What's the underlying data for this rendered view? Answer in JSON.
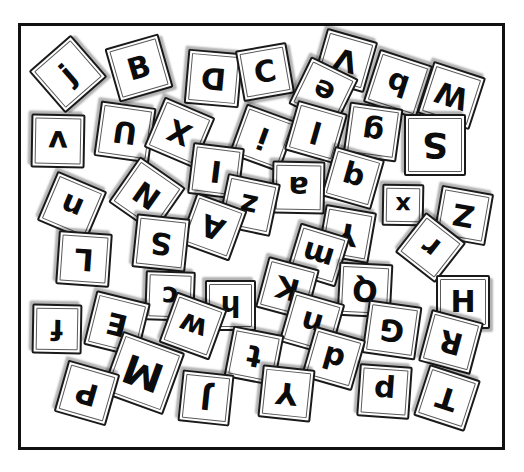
{
  "scene": {
    "title": "Scattered letter tiles inside a rectangular frame",
    "background_color": "#ffffff",
    "frame": {
      "stroke_color": "#111111",
      "fill_color": "#ffffff",
      "stroke_width": 3,
      "x": 18,
      "y": 23,
      "width": 487,
      "height": 427
    },
    "tile_style": {
      "fill_color": "#ffffff",
      "stroke_color": "#1a1a1a",
      "glyph_color": "#0c0c0c",
      "shadow_color": "rgba(0,0,0,0.30)"
    },
    "tile_count": 52
  },
  "tiles": [
    {
      "letter": "j",
      "x": 40,
      "y": 46,
      "size": 56,
      "rot": -41,
      "font": 30
    },
    {
      "letter": "B",
      "x": 111,
      "y": 40,
      "size": 56,
      "rot": -16,
      "font": 30
    },
    {
      "letter": "D",
      "x": 186,
      "y": 51,
      "size": 55,
      "rot": 185,
      "font": 30
    },
    {
      "letter": "C",
      "x": 239,
      "y": 46,
      "size": 52,
      "rot": -10,
      "font": 30
    },
    {
      "letter": "V",
      "x": 319,
      "y": 34,
      "size": 53,
      "rot": 196,
      "font": 30
    },
    {
      "letter": "e",
      "x": 297,
      "y": 65,
      "size": 53,
      "rot": 206,
      "font": 30
    },
    {
      "letter": "b",
      "x": 370,
      "y": 56,
      "size": 56,
      "rot": 198,
      "font": 30
    },
    {
      "letter": "W",
      "x": 424,
      "y": 68,
      "size": 55,
      "rot": 198,
      "font": 30
    },
    {
      "letter": "v",
      "x": 31,
      "y": 114,
      "size": 54,
      "rot": 181,
      "font": 30
    },
    {
      "letter": "U",
      "x": 97,
      "y": 104,
      "size": 56,
      "rot": 188,
      "font": 30
    },
    {
      "letter": "X",
      "x": 152,
      "y": 105,
      "size": 55,
      "rot": 203,
      "font": 30
    },
    {
      "letter": "i",
      "x": 236,
      "y": 111,
      "size": 54,
      "rot": 200,
      "font": 30
    },
    {
      "letter": "l",
      "x": 290,
      "y": 106,
      "size": 52,
      "rot": 196,
      "font": 30
    },
    {
      "letter": "g",
      "x": 346,
      "y": 105,
      "size": 54,
      "rot": 188,
      "font": 30
    },
    {
      "letter": "S",
      "x": 404,
      "y": 114,
      "size": 62,
      "rot": 180,
      "font": 36
    },
    {
      "letter": "I",
      "x": 190,
      "y": 145,
      "size": 52,
      "rot": 187,
      "font": 30
    },
    {
      "letter": "q",
      "x": 327,
      "y": 152,
      "size": 52,
      "rot": 196,
      "font": 30
    },
    {
      "letter": "a",
      "x": 272,
      "y": 161,
      "size": 53,
      "rot": 181,
      "font": 30
    },
    {
      "letter": "n",
      "x": 45,
      "y": 179,
      "size": 54,
      "rot": 203,
      "font": 30
    },
    {
      "letter": "N",
      "x": 119,
      "y": 167,
      "size": 56,
      "rot": 215,
      "font": 30
    },
    {
      "letter": "z",
      "x": 222,
      "y": 178,
      "size": 54,
      "rot": 192,
      "font": 30
    },
    {
      "letter": "x",
      "x": 382,
      "y": 184,
      "size": 42,
      "rot": 181,
      "font": 24
    },
    {
      "letter": "Z",
      "x": 437,
      "y": 189,
      "size": 53,
      "rot": 190,
      "font": 30
    },
    {
      "letter": "A",
      "x": 186,
      "y": 200,
      "size": 54,
      "rot": 200,
      "font": 30
    },
    {
      "letter": "S",
      "x": 134,
      "y": 216,
      "size": 54,
      "rot": 186,
      "font": 30
    },
    {
      "letter": "Y",
      "x": 321,
      "y": 208,
      "size": 52,
      "rot": 190,
      "font": 30
    },
    {
      "letter": "r",
      "x": 405,
      "y": 222,
      "size": 51,
      "rot": 218,
      "font": 30
    },
    {
      "letter": "L",
      "x": 57,
      "y": 232,
      "size": 54,
      "rot": 184,
      "font": 30
    },
    {
      "letter": "m",
      "x": 292,
      "y": 229,
      "size": 52,
      "rot": 197,
      "font": 30
    },
    {
      "letter": "Q",
      "x": 338,
      "y": 263,
      "size": 54,
      "rot": 183,
      "font": 30
    },
    {
      "letter": "c",
      "x": 145,
      "y": 271,
      "size": 50,
      "rot": 182,
      "font": 28
    },
    {
      "letter": "K",
      "x": 261,
      "y": 262,
      "size": 53,
      "rot": 195,
      "font": 30
    },
    {
      "letter": "h",
      "x": 205,
      "y": 280,
      "size": 51,
      "rot": 180,
      "font": 28
    },
    {
      "letter": "H",
      "x": 436,
      "y": 275,
      "size": 54,
      "rot": 0,
      "font": 30
    },
    {
      "letter": "E",
      "x": 89,
      "y": 296,
      "size": 56,
      "rot": 194,
      "font": 30
    },
    {
      "letter": "f",
      "x": 32,
      "y": 304,
      "size": 50,
      "rot": 181,
      "font": 28
    },
    {
      "letter": "w",
      "x": 166,
      "y": 299,
      "size": 54,
      "rot": 200,
      "font": 30
    },
    {
      "letter": "n",
      "x": 285,
      "y": 296,
      "size": 54,
      "rot": 196,
      "font": 30
    },
    {
      "letter": "G",
      "x": 365,
      "y": 303,
      "size": 54,
      "rot": 188,
      "font": 30
    },
    {
      "letter": "R",
      "x": 424,
      "y": 315,
      "size": 54,
      "rot": 195,
      "font": 30
    },
    {
      "letter": "t",
      "x": 228,
      "y": 330,
      "size": 52,
      "rot": 191,
      "font": 30
    },
    {
      "letter": "d",
      "x": 307,
      "y": 332,
      "size": 53,
      "rot": 196,
      "font": 30
    },
    {
      "letter": "M",
      "x": 110,
      "y": 340,
      "size": 66,
      "rot": 200,
      "font": 40
    },
    {
      "letter": "Y",
      "x": 260,
      "y": 367,
      "size": 53,
      "rot": 186,
      "font": 30
    },
    {
      "letter": "p",
      "x": 358,
      "y": 365,
      "size": 53,
      "rot": 184,
      "font": 30
    },
    {
      "letter": "T",
      "x": 420,
      "y": 371,
      "size": 54,
      "rot": 198,
      "font": 30
    },
    {
      "letter": "P",
      "x": 60,
      "y": 366,
      "size": 54,
      "rot": 196,
      "font": 30
    },
    {
      "letter": "J",
      "x": 180,
      "y": 372,
      "size": 52,
      "rot": 186,
      "font": 30
    }
  ]
}
